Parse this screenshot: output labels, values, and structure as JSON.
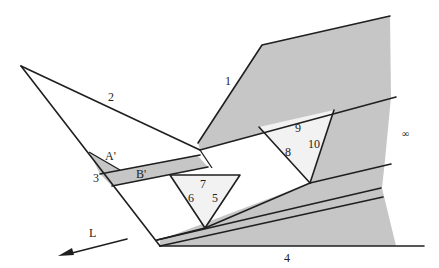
{
  "diagram": {
    "colors": {
      "shade": "#c6c6c6",
      "light": "#f2f2f2",
      "line": "#1f1f1f",
      "background": "#ffffff"
    },
    "labels": {
      "l1": "1",
      "l2": "2",
      "l3": "3",
      "l4": "4",
      "l5": "5",
      "l6": "6",
      "l7": "7",
      "l8": "8",
      "l9": "9",
      "l10": "10",
      "a_prime": "A'",
      "b_prime": "B'",
      "infinity": "∞",
      "arrow": "L"
    },
    "arrow": {
      "direction": "left-down",
      "label": "L"
    }
  }
}
